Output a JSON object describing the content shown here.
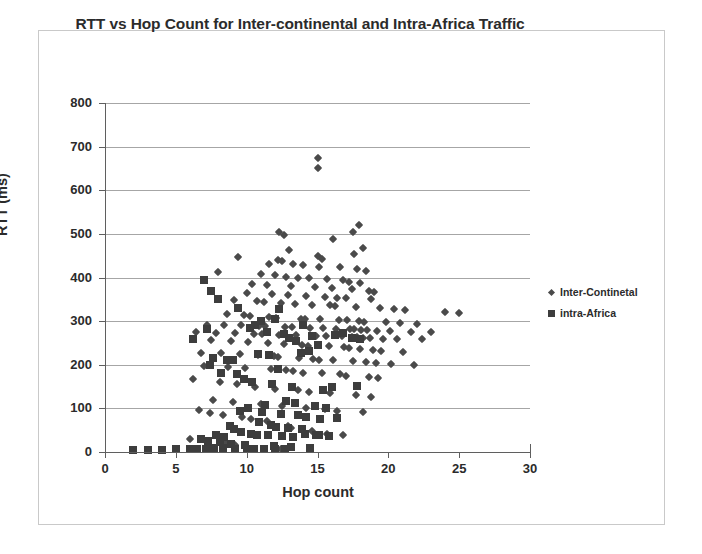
{
  "chart_data": {
    "type": "scatter",
    "title": "RTT vs Hop Count for Inter-continental and Intra-Africa Traffic",
    "xlabel": "Hop count",
    "ylabel": "RTT (ms)",
    "xlim": [
      0,
      30
    ],
    "ylim": [
      0,
      800
    ],
    "xticks": [
      0,
      5,
      10,
      15,
      20,
      25,
      30
    ],
    "yticks": [
      0,
      100,
      200,
      300,
      400,
      500,
      600,
      700,
      800
    ],
    "grid": "horizontal",
    "legend_position": "right",
    "series": [
      {
        "name": "Inter-Continetal",
        "marker": "diamond",
        "color": "#4a4a4a",
        "points": [
          [
            15.0,
            675
          ],
          [
            15.0,
            650
          ],
          [
            17.9,
            520
          ],
          [
            17.5,
            505
          ],
          [
            12.3,
            505
          ],
          [
            12.6,
            497
          ],
          [
            16.1,
            488
          ],
          [
            18.2,
            468
          ],
          [
            13.0,
            462
          ],
          [
            17.6,
            455
          ],
          [
            15.0,
            450
          ],
          [
            15.3,
            443
          ],
          [
            9.4,
            447
          ],
          [
            12.2,
            440
          ],
          [
            12.5,
            437
          ],
          [
            13.3,
            432
          ],
          [
            11.6,
            430
          ],
          [
            14.0,
            428
          ],
          [
            15.1,
            425
          ],
          [
            16.6,
            424
          ],
          [
            17.8,
            420
          ],
          [
            18.4,
            415
          ],
          [
            8.0,
            412
          ],
          [
            11.0,
            408
          ],
          [
            12.0,
            405
          ],
          [
            12.8,
            402
          ],
          [
            13.6,
            400
          ],
          [
            14.4,
            398
          ],
          [
            15.7,
            396
          ],
          [
            16.8,
            394
          ],
          [
            17.2,
            390
          ],
          [
            18.0,
            388
          ],
          [
            10.4,
            385
          ],
          [
            11.4,
            382
          ],
          [
            13.1,
            380
          ],
          [
            14.8,
            378
          ],
          [
            16.0,
            375
          ],
          [
            17.4,
            373
          ],
          [
            18.6,
            370
          ],
          [
            19.0,
            366
          ],
          [
            10.0,
            365
          ],
          [
            11.8,
            362
          ],
          [
            12.9,
            360
          ],
          [
            14.2,
            358
          ],
          [
            15.5,
            356
          ],
          [
            16.4,
            354
          ],
          [
            17.0,
            352
          ],
          [
            18.8,
            350
          ],
          [
            9.1,
            348
          ],
          [
            10.7,
            346
          ],
          [
            11.2,
            344
          ],
          [
            12.4,
            342
          ],
          [
            13.4,
            340
          ],
          [
            14.6,
            338
          ],
          [
            15.9,
            336
          ],
          [
            16.2,
            334
          ],
          [
            17.7,
            332
          ],
          [
            19.4,
            330
          ],
          [
            20.4,
            328
          ],
          [
            21.2,
            326
          ],
          [
            24.0,
            320
          ],
          [
            25.0,
            318
          ],
          [
            8.6,
            316
          ],
          [
            9.8,
            314
          ],
          [
            10.2,
            312
          ],
          [
            11.6,
            310
          ],
          [
            12.1,
            308
          ],
          [
            13.8,
            306
          ],
          [
            14.1,
            305
          ],
          [
            15.2,
            304
          ],
          [
            16.5,
            303
          ],
          [
            17.1,
            302
          ],
          [
            17.9,
            300
          ],
          [
            18.3,
            299
          ],
          [
            19.8,
            298
          ],
          [
            20.8,
            296
          ],
          [
            22.0,
            294
          ],
          [
            7.2,
            292
          ],
          [
            8.4,
            291
          ],
          [
            9.6,
            290
          ],
          [
            10.9,
            289
          ],
          [
            11.3,
            288
          ],
          [
            12.7,
            287
          ],
          [
            13.2,
            286
          ],
          [
            14.5,
            285
          ],
          [
            15.4,
            284
          ],
          [
            16.3,
            283
          ],
          [
            17.3,
            282
          ],
          [
            17.6,
            281
          ],
          [
            18.1,
            280
          ],
          [
            18.5,
            279
          ],
          [
            19.2,
            278
          ],
          [
            20.1,
            277
          ],
          [
            21.6,
            276
          ],
          [
            23.0,
            275
          ],
          [
            6.4,
            274
          ],
          [
            7.8,
            273
          ],
          [
            9.2,
            272
          ],
          [
            10.5,
            271
          ],
          [
            11.1,
            270
          ],
          [
            12.3,
            269
          ],
          [
            13.5,
            268
          ],
          [
            14.9,
            267
          ],
          [
            15.6,
            266
          ],
          [
            16.7,
            265
          ],
          [
            17.4,
            264
          ],
          [
            17.8,
            263
          ],
          [
            18.2,
            262
          ],
          [
            18.7,
            261
          ],
          [
            19.6,
            260
          ],
          [
            20.6,
            259
          ],
          [
            22.4,
            258
          ],
          [
            7.5,
            256
          ],
          [
            8.9,
            254
          ],
          [
            10.1,
            252
          ],
          [
            11.5,
            250
          ],
          [
            12.6,
            248
          ],
          [
            13.9,
            246
          ],
          [
            14.3,
            244
          ],
          [
            15.8,
            242
          ],
          [
            16.9,
            240
          ],
          [
            17.2,
            238
          ],
          [
            18.0,
            236
          ],
          [
            18.9,
            234
          ],
          [
            19.5,
            232
          ],
          [
            21.0,
            230
          ],
          [
            6.8,
            228
          ],
          [
            8.2,
            226
          ],
          [
            9.5,
            224
          ],
          [
            10.8,
            222
          ],
          [
            11.9,
            220
          ],
          [
            12.2,
            218
          ],
          [
            13.7,
            216
          ],
          [
            14.7,
            214
          ],
          [
            15.1,
            212
          ],
          [
            16.1,
            210
          ],
          [
            17.5,
            208
          ],
          [
            18.4,
            206
          ],
          [
            19.1,
            204
          ],
          [
            20.2,
            202
          ],
          [
            21.8,
            200
          ],
          [
            7.0,
            198
          ],
          [
            8.7,
            195
          ],
          [
            9.9,
            192
          ],
          [
            11.7,
            190
          ],
          [
            12.8,
            188
          ],
          [
            13.3,
            185
          ],
          [
            14.0,
            182
          ],
          [
            15.3,
            180
          ],
          [
            16.6,
            178
          ],
          [
            17.0,
            175
          ],
          [
            18.6,
            172
          ],
          [
            19.3,
            170
          ],
          [
            6.2,
            168
          ],
          [
            8.1,
            160
          ],
          [
            9.3,
            155
          ],
          [
            10.6,
            150
          ],
          [
            12.0,
            145
          ],
          [
            13.6,
            142
          ],
          [
            14.4,
            138
          ],
          [
            15.9,
            135
          ],
          [
            17.7,
            130
          ],
          [
            18.8,
            125
          ],
          [
            7.6,
            120
          ],
          [
            9.0,
            115
          ],
          [
            11.0,
            110
          ],
          [
            12.5,
            105
          ],
          [
            14.2,
            100
          ],
          [
            15.5,
            98
          ],
          [
            16.4,
            95
          ],
          [
            18.2,
            92
          ],
          [
            6.6,
            96
          ],
          [
            7.4,
            90
          ],
          [
            8.3,
            85
          ],
          [
            9.7,
            80
          ],
          [
            10.3,
            75
          ],
          [
            11.4,
            70
          ],
          [
            12.9,
            60
          ],
          [
            13.1,
            55
          ],
          [
            14.6,
            48
          ],
          [
            15.7,
            42
          ],
          [
            16.8,
            38
          ],
          [
            6.0,
            30
          ],
          [
            7.1,
            25
          ],
          [
            8.5,
            20
          ],
          [
            9.2,
            15
          ],
          [
            10.0,
            10
          ],
          [
            11.2,
            8
          ],
          [
            12.4,
            6
          ]
        ]
      },
      {
        "name": "intra-Africa",
        "marker": "square",
        "color": "#3d3d3d",
        "points": [
          [
            7.0,
            395
          ],
          [
            7.5,
            368
          ],
          [
            8.0,
            350
          ],
          [
            9.4,
            330
          ],
          [
            12.3,
            328
          ],
          [
            6.2,
            258
          ],
          [
            7.2,
            282
          ],
          [
            7.6,
            215
          ],
          [
            7.4,
            200
          ],
          [
            8.6,
            212
          ],
          [
            9.0,
            210
          ],
          [
            8.2,
            180
          ],
          [
            9.3,
            178
          ],
          [
            10.2,
            285
          ],
          [
            10.6,
            290
          ],
          [
            11.0,
            300
          ],
          [
            11.4,
            275
          ],
          [
            12.0,
            305
          ],
          [
            12.6,
            270
          ],
          [
            13.0,
            262
          ],
          [
            13.5,
            255
          ],
          [
            14.0,
            290
          ],
          [
            14.6,
            266
          ],
          [
            15.0,
            245
          ],
          [
            16.2,
            268
          ],
          [
            16.8,
            272
          ],
          [
            17.4,
            262
          ],
          [
            18.0,
            258
          ],
          [
            13.8,
            228
          ],
          [
            14.4,
            232
          ],
          [
            10.8,
            225
          ],
          [
            11.6,
            222
          ],
          [
            12.2,
            190
          ],
          [
            9.8,
            168
          ],
          [
            10.4,
            160
          ],
          [
            11.8,
            155
          ],
          [
            13.2,
            148
          ],
          [
            15.4,
            142
          ],
          [
            16.0,
            150
          ],
          [
            17.8,
            152
          ],
          [
            12.8,
            118
          ],
          [
            13.4,
            112
          ],
          [
            14.8,
            105
          ],
          [
            15.6,
            100
          ],
          [
            11.3,
            108
          ],
          [
            10.1,
            100
          ],
          [
            9.5,
            95
          ],
          [
            11.1,
            92
          ],
          [
            12.4,
            88
          ],
          [
            13.6,
            85
          ],
          [
            14.2,
            80
          ],
          [
            15.2,
            75
          ],
          [
            16.4,
            78
          ],
          [
            10.9,
            68
          ],
          [
            11.7,
            62
          ],
          [
            12.1,
            58
          ],
          [
            12.9,
            55
          ],
          [
            13.9,
            52
          ],
          [
            8.8,
            60
          ],
          [
            9.1,
            52
          ],
          [
            9.6,
            45
          ],
          [
            10.3,
            42
          ],
          [
            10.7,
            40
          ],
          [
            11.5,
            38
          ],
          [
            12.5,
            36
          ],
          [
            13.3,
            34
          ],
          [
            14.1,
            42
          ],
          [
            14.9,
            38
          ],
          [
            15.8,
            36
          ],
          [
            7.8,
            40
          ],
          [
            8.4,
            35
          ],
          [
            6.8,
            30
          ],
          [
            7.3,
            26
          ],
          [
            8.1,
            22
          ],
          [
            8.9,
            18
          ],
          [
            9.9,
            16
          ],
          [
            11.9,
            14
          ],
          [
            13.1,
            12
          ],
          [
            15.1,
            40
          ],
          [
            14.5,
            10
          ],
          [
            2.0,
            5
          ],
          [
            3.0,
            5
          ],
          [
            4.0,
            5
          ],
          [
            5.0,
            6
          ],
          [
            6.0,
            6
          ],
          [
            6.5,
            8
          ],
          [
            7.1,
            8
          ],
          [
            7.7,
            10
          ],
          [
            8.3,
            10
          ],
          [
            9.2,
            8
          ],
          [
            10.0,
            8
          ],
          [
            10.5,
            7
          ],
          [
            11.2,
            7
          ],
          [
            12.0,
            6
          ],
          [
            12.7,
            6
          ]
        ]
      }
    ]
  },
  "legend": {
    "items": [
      {
        "label": "Inter-Continetal",
        "marker": "diamond"
      },
      {
        "label": "intra-Africa",
        "marker": "square"
      }
    ]
  }
}
